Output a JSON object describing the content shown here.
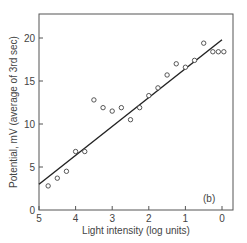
{
  "chart_data": {
    "type": "scatter",
    "title": "",
    "panel_label": "(b)",
    "xlabel": "Light intensity (log units)",
    "ylabel": "Potential, mV (average of 3rd sec)",
    "xlim": [
      5,
      0
    ],
    "ylim": [
      0,
      22
    ],
    "x_ticks": [
      "5",
      "4",
      "3",
      "2",
      "1",
      "0"
    ],
    "y_ticks": [
      "0",
      "5",
      "10",
      "15",
      "20"
    ],
    "grid": false,
    "legend": null,
    "series": [
      {
        "name": "measurements",
        "marker": "open-circle",
        "points": [
          {
            "x": 4.75,
            "y": 2.8
          },
          {
            "x": 4.5,
            "y": 3.7
          },
          {
            "x": 4.25,
            "y": 4.5
          },
          {
            "x": 4.0,
            "y": 6.8
          },
          {
            "x": 3.75,
            "y": 6.8
          },
          {
            "x": 3.5,
            "y": 12.8
          },
          {
            "x": 3.25,
            "y": 11.9
          },
          {
            "x": 3.0,
            "y": 11.5
          },
          {
            "x": 2.75,
            "y": 11.9
          },
          {
            "x": 2.5,
            "y": 10.5
          },
          {
            "x": 2.25,
            "y": 11.9
          },
          {
            "x": 2.0,
            "y": 13.3
          },
          {
            "x": 1.75,
            "y": 14.2
          },
          {
            "x": 1.5,
            "y": 15.7
          },
          {
            "x": 1.25,
            "y": 17.0
          },
          {
            "x": 1.0,
            "y": 16.6
          },
          {
            "x": 0.75,
            "y": 17.4
          },
          {
            "x": 0.5,
            "y": 19.4
          },
          {
            "x": 0.25,
            "y": 18.4
          },
          {
            "x": 0.1,
            "y": 18.4
          },
          {
            "x": -0.05,
            "y": 18.4
          }
        ]
      },
      {
        "name": "fit",
        "type": "line",
        "points": [
          {
            "x": 5,
            "y": 3.0
          },
          {
            "x": 0,
            "y": 19.8
          }
        ]
      }
    ]
  }
}
